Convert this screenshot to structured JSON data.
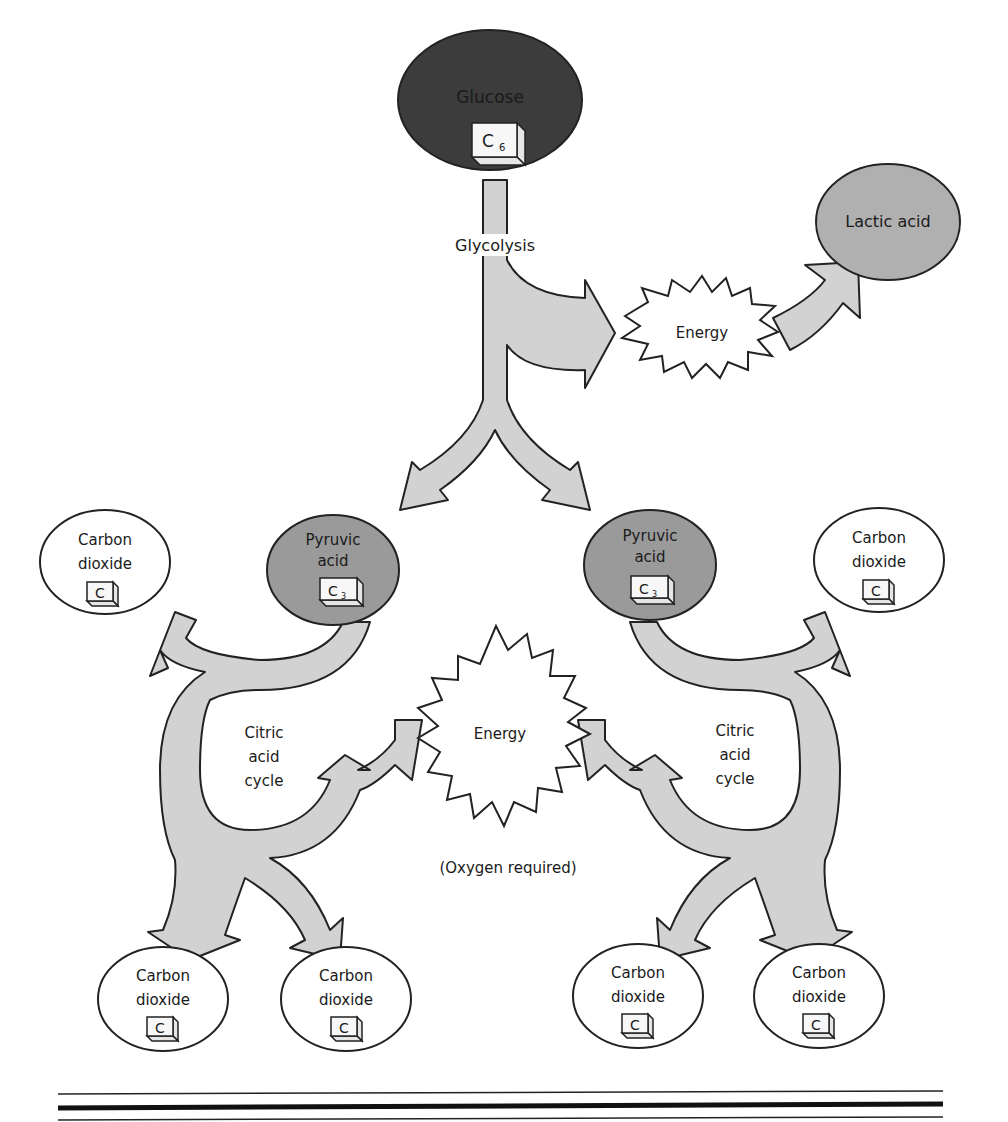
{
  "diagram": {
    "colors": {
      "glucose_fill": "#3c3c3c",
      "pyruvic_fill": "#9a9a9a",
      "lactic_fill": "#b0b0b0",
      "arrow_fill": "#d2d2d2",
      "outline": "#222222",
      "background": "#ffffff"
    },
    "nodes": {
      "glucose": {
        "label": "Glucose",
        "carbon": "C",
        "carbon_sub": "6"
      },
      "glycolysis": {
        "label": "Glycolysis"
      },
      "energy_anaerobic": {
        "label": "Energy"
      },
      "lactic_acid": {
        "label": "Lactic acid"
      },
      "pyruvic_left": {
        "line1": "Pyruvic",
        "line2": "acid",
        "carbon": "C",
        "carbon_sub": "3"
      },
      "pyruvic_right": {
        "line1": "Pyruvic",
        "line2": "acid",
        "carbon": "C",
        "carbon_sub": "3"
      },
      "citric_left": {
        "line1": "Citric",
        "line2": "acid",
        "line3": "cycle"
      },
      "citric_right": {
        "line1": "Citric",
        "line2": "acid",
        "line3": "cycle"
      },
      "energy_aerobic": {
        "label": "Energy"
      },
      "oxygen_note": {
        "label": "(Oxygen required)"
      },
      "co2_top_left": {
        "line1": "Carbon",
        "line2": "dioxide",
        "carbon": "C"
      },
      "co2_top_right": {
        "line1": "Carbon",
        "line2": "dioxide",
        "carbon": "C"
      },
      "co2_bottom_1": {
        "line1": "Carbon",
        "line2": "dioxide",
        "carbon": "C"
      },
      "co2_bottom_2": {
        "line1": "Carbon",
        "line2": "dioxide",
        "carbon": "C"
      },
      "co2_bottom_3": {
        "line1": "Carbon",
        "line2": "dioxide",
        "carbon": "C"
      },
      "co2_bottom_4": {
        "line1": "Carbon",
        "line2": "dioxide",
        "carbon": "C"
      }
    }
  }
}
